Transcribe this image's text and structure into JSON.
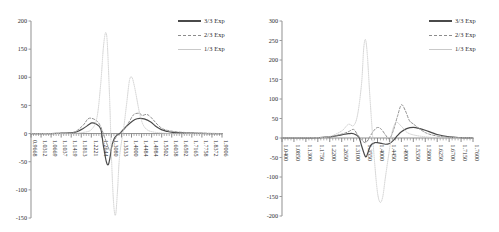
{
  "figure": {
    "background": "#ffffff",
    "panel_count": 2
  },
  "legend": {
    "entries": [
      {
        "label": "3/3 Exp",
        "style": "solid",
        "color": "#4a4a4a",
        "icon": "line-solid-icon"
      },
      {
        "label": "2/3 Exp",
        "style": "dashed",
        "color": "#8c8c8c",
        "icon": "line-dashed-icon"
      },
      {
        "label": "1/3 Exp",
        "style": "light",
        "color": "#c9c9c9",
        "icon": "line-light-icon"
      }
    ]
  },
  "chart_data": [
    {
      "type": "line",
      "title": "",
      "xlabel": "",
      "ylabel": "",
      "grid": false,
      "legend_position": "top-right",
      "ylim": [
        -150,
        200
      ],
      "yticks": [
        "200",
        "150",
        "100",
        "50",
        "0",
        "-50",
        "-100",
        "-150"
      ],
      "ytick_values": [
        200,
        150,
        100,
        50,
        0,
        -50,
        -100,
        -150
      ],
      "xlim": [
        0.9668,
        1.9006
      ],
      "xtick_labels": [
        "0.9668",
        "1.0312",
        "1.0669",
        "1.1037",
        "1.1419",
        "1.1813",
        "1.2221",
        "1.2644",
        "1.3080",
        "1.3533",
        "1.4000",
        "1.4484",
        "1.4984",
        "1.5502",
        "1.6038",
        "1.6592",
        "1.7165",
        "1.7758",
        "1.8372",
        "1.9006"
      ],
      "minor_ticks_per_interval": 3,
      "series": [
        {
          "name": "3/3 Exp",
          "style": "solid",
          "color": "#4a4a4a",
          "x": [
            0.9668,
            1.0312,
            1.0669,
            1.1037,
            1.1419,
            1.1813,
            1.2221,
            1.25,
            1.2644,
            1.285,
            1.308,
            1.32,
            1.335,
            1.345,
            1.3533,
            1.362,
            1.375,
            1.39,
            1.4,
            1.42,
            1.4484,
            1.475,
            1.4984,
            1.52,
            1.5502,
            1.58,
            1.6038,
            1.63,
            1.6592,
            1.7165,
            1.7758,
            1.8372,
            1.9006
          ],
          "y": [
            0,
            0,
            0,
            0.5,
            1,
            2,
            9,
            16,
            19,
            17,
            8,
            -20,
            -50,
            -55,
            -42,
            -22,
            -8,
            -2,
            0,
            8,
            18,
            25,
            27,
            26,
            21,
            12,
            7,
            4,
            2,
            1,
            0.5,
            0,
            0
          ]
        },
        {
          "name": "2/3 Exp",
          "style": "dashed",
          "color": "#8c8c8c",
          "x": [
            0.9668,
            1.0669,
            1.1419,
            1.1813,
            1.2221,
            1.245,
            1.2644,
            1.29,
            1.308,
            1.33,
            1.3533,
            1.37,
            1.39,
            1.4,
            1.42,
            1.4484,
            1.47,
            1.4984,
            1.51,
            1.53,
            1.5502,
            1.6038,
            1.6592,
            1.7165,
            1.7758,
            1.9006
          ],
          "y": [
            0,
            0,
            1,
            3,
            15,
            26,
            27,
            22,
            12,
            -10,
            -30,
            -15,
            -2,
            0,
            6,
            22,
            34,
            36,
            32,
            34,
            30,
            10,
            4,
            2,
            1,
            0
          ]
        },
        {
          "name": "1/3 Exp",
          "style": "light",
          "color": "#c9c9c9",
          "x": [
            0.9668,
            1.1419,
            1.2221,
            1.2644,
            1.29,
            1.308,
            1.32,
            1.33,
            1.338,
            1.345,
            1.3533,
            1.36,
            1.37,
            1.38,
            1.39,
            1.4,
            1.42,
            1.435,
            1.4484,
            1.46,
            1.47,
            1.48,
            1.49,
            1.4984,
            1.51,
            1.525,
            1.5502,
            1.6038,
            1.6592,
            1.7165,
            1.9006
          ],
          "y": [
            0,
            0,
            2,
            8,
            30,
            90,
            150,
            178,
            170,
            120,
            40,
            -40,
            -120,
            -145,
            -100,
            -40,
            10,
            55,
            95,
            100,
            88,
            70,
            50,
            35,
            20,
            10,
            4,
            1,
            0,
            0,
            0
          ]
        }
      ]
    },
    {
      "type": "line",
      "title": "",
      "xlabel": "",
      "ylabel": "",
      "grid": false,
      "legend_position": "top-right",
      "ylim": [
        -200,
        300
      ],
      "yticks": [
        "300",
        "250",
        "200",
        "150",
        "100",
        "50",
        "0",
        "-50",
        "-100",
        "-150",
        "-200"
      ],
      "ytick_values": [
        300,
        250,
        200,
        150,
        100,
        50,
        0,
        -50,
        -100,
        -150,
        -200
      ],
      "xlim": [
        1.04,
        1.76
      ],
      "xtick_labels": [
        "1.0400",
        "1.0850",
        "1.1300",
        "1.1750",
        "1.2200",
        "1.2650",
        "1.3100",
        "1.3550",
        "1.4000",
        "1.4450",
        "1.4900",
        "1.5350",
        "1.5800",
        "1.6250",
        "1.6700",
        "1.7150",
        "1.7600"
      ],
      "minor_ticks_per_interval": 3,
      "series": [
        {
          "name": "3/3 Exp",
          "style": "solid",
          "color": "#4a4a4a",
          "x": [
            1.04,
            1.13,
            1.175,
            1.22,
            1.265,
            1.29,
            1.31,
            1.33,
            1.34,
            1.355,
            1.365,
            1.375,
            1.39,
            1.4,
            1.415,
            1.43,
            1.445,
            1.46,
            1.475,
            1.49,
            1.51,
            1.535,
            1.56,
            1.58,
            1.625,
            1.67,
            1.715,
            1.76
          ],
          "y": [
            0,
            0,
            1,
            3,
            8,
            11,
            11,
            2,
            -20,
            -48,
            -35,
            -18,
            -12,
            -12,
            -14,
            -16,
            -14,
            -6,
            6,
            16,
            24,
            27,
            24,
            20,
            9,
            3,
            1,
            0
          ]
        },
        {
          "name": "2/3 Exp",
          "style": "dashed",
          "color": "#8c8c8c",
          "x": [
            1.04,
            1.175,
            1.22,
            1.265,
            1.29,
            1.31,
            1.325,
            1.34,
            1.355,
            1.37,
            1.385,
            1.4,
            1.415,
            1.43,
            1.445,
            1.46,
            1.475,
            1.49,
            1.505,
            1.52,
            1.535,
            1.58,
            1.625,
            1.67,
            1.76
          ],
          "y": [
            0,
            1,
            3,
            10,
            16,
            22,
            8,
            -5,
            -12,
            2,
            18,
            27,
            22,
            8,
            -2,
            20,
            55,
            85,
            70,
            45,
            36,
            14,
            5,
            2,
            0
          ]
        },
        {
          "name": "1/3 Exp",
          "style": "light",
          "color": "#c9c9c9",
          "x": [
            1.04,
            1.175,
            1.22,
            1.265,
            1.29,
            1.31,
            1.325,
            1.34,
            1.348,
            1.355,
            1.362,
            1.37,
            1.38,
            1.39,
            1.4,
            1.41,
            1.42,
            1.43,
            1.445,
            1.455,
            1.47,
            1.49,
            1.51,
            1.535,
            1.58,
            1.625,
            1.76
          ],
          "y": [
            0,
            1,
            4,
            18,
            35,
            32,
            60,
            140,
            230,
            252,
            210,
            120,
            20,
            -70,
            -140,
            -165,
            -150,
            -100,
            -30,
            15,
            40,
            30,
            15,
            8,
            3,
            1,
            0
          ]
        }
      ]
    }
  ]
}
